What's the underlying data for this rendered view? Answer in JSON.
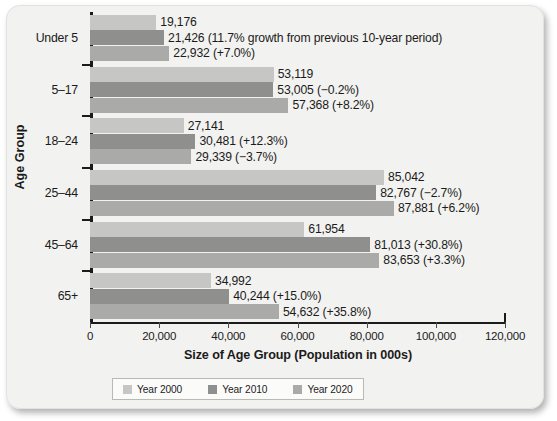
{
  "chart_data": {
    "type": "bar",
    "orientation": "horizontal",
    "title": "",
    "xlabel": "Size of Age Group (Population in 000s)",
    "ylabel": "Age Group",
    "categories": [
      "Under 5",
      "5–17",
      "18–24",
      "25–44",
      "45–64",
      "65+"
    ],
    "xlim": [
      0,
      120000
    ],
    "xticks": [
      0,
      20000,
      40000,
      60000,
      80000,
      100000,
      120000
    ],
    "xticklabels": [
      "0",
      "20,000",
      "40,000",
      "60,000",
      "80,000",
      "100,000",
      "120,000"
    ],
    "grid": false,
    "legend_position": "bottom",
    "series": [
      {
        "name": "Year 2000",
        "color": "#c6c6c4",
        "values": [
          19176,
          53119,
          27141,
          85042,
          61954,
          34992
        ],
        "labels": [
          "19,176",
          "53,119",
          "27,141",
          "85,042",
          "61,954",
          "34,992"
        ]
      },
      {
        "name": "Year 2010",
        "color": "#8f8f8d",
        "values": [
          21426,
          53005,
          30481,
          82767,
          81013,
          40244
        ],
        "labels": [
          "21,426 (11.7% growth from previous 10-year period)",
          "53,005 (−0.2%)",
          "30,481 (+12.3%)",
          "82,767 (−2.7%)",
          "81,013 (+30.8%)",
          "40,244 (+15.0%)"
        ]
      },
      {
        "name": "Year 2020",
        "color": "#aaaaa8",
        "values": [
          22932,
          57368,
          29339,
          87881,
          83653,
          54632
        ],
        "labels": [
          "22,932 (+7.0%)",
          "57,368 (+8.2%)",
          "29,339 (−3.7%)",
          "87,881 (+6.2%)",
          "83,653 (+3.3%)",
          "54,632 (+35.8%)"
        ]
      }
    ]
  },
  "legend": {
    "items": [
      {
        "label": "Year 2000",
        "color": "#c6c6c4"
      },
      {
        "label": "Year 2010",
        "color": "#8f8f8d"
      },
      {
        "label": "Year 2020",
        "color": "#aaaaa8"
      }
    ]
  }
}
